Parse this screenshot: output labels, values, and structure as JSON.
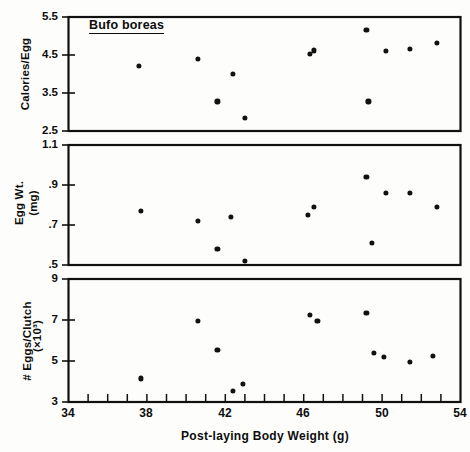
{
  "figure": {
    "species_label": "Bufo boreas",
    "xaxis_title": "Post-laying Body Weight (g)",
    "xticks": [
      "34",
      "38",
      "42",
      "46",
      "50",
      "54"
    ],
    "panels": [
      {
        "name": "calories-per-egg",
        "ylabel": "Calories/Egg",
        "ylabel2": "",
        "yticks": [
          "5.5",
          "4.5",
          "3.5",
          "2.5"
        ]
      },
      {
        "name": "egg-weight",
        "ylabel": "Egg Wt.",
        "ylabel2": "(mg)",
        "yticks": [
          "1.1",
          ".9",
          ".7",
          ".5"
        ]
      },
      {
        "name": "eggs-per-clutch",
        "ylabel": "# Eggs/Clutch",
        "ylabel2": "(×10³)",
        "yticks": [
          "9",
          "7",
          "5",
          "3"
        ]
      }
    ]
  },
  "chart_data": [
    {
      "type": "scatter",
      "title": "Bufo boreas",
      "panel": "Calories/Egg",
      "xlabel": "Post-laying Body Weight (g)",
      "ylabel": "Calories/Egg",
      "xlim": [
        34,
        54
      ],
      "ylim": [
        2.5,
        5.5
      ],
      "xticks": [
        34,
        38,
        42,
        46,
        50,
        54
      ],
      "yticks": [
        2.5,
        3.5,
        4.5,
        5.5
      ],
      "grid": false,
      "legend": "none",
      "x": [
        37.6,
        40.6,
        41.6,
        42.4,
        43.0,
        46.3,
        46.5,
        49.2,
        49.3,
        50.2,
        51.4,
        52.8
      ],
      "y": [
        4.22,
        4.4,
        3.28,
        4.0,
        2.84,
        4.52,
        4.62,
        5.15,
        3.28,
        4.6,
        4.65,
        4.82
      ]
    },
    {
      "type": "scatter",
      "panel": "Egg Wt. (mg)",
      "xlabel": "Post-laying Body Weight (g)",
      "ylabel": "Egg Wt. (mg)",
      "xlim": [
        34,
        54
      ],
      "ylim": [
        0.5,
        1.1
      ],
      "xticks": [
        34,
        38,
        42,
        46,
        50,
        54
      ],
      "yticks": [
        0.5,
        0.7,
        0.9,
        1.1
      ],
      "grid": false,
      "legend": "none",
      "x": [
        37.7,
        40.6,
        41.6,
        42.3,
        43.0,
        46.2,
        46.5,
        49.2,
        49.5,
        50.2,
        51.4,
        52.8
      ],
      "y": [
        0.77,
        0.72,
        0.58,
        0.74,
        0.52,
        0.75,
        0.79,
        0.94,
        0.61,
        0.86,
        0.86,
        0.79
      ]
    },
    {
      "type": "scatter",
      "panel": "# Eggs/Clutch (×10³)",
      "xlabel": "Post-laying Body Weight (g)",
      "ylabel": "# Eggs/Clutch (×10³)",
      "xlim": [
        34,
        54
      ],
      "ylim": [
        3,
        9
      ],
      "xticks": [
        34,
        38,
        42,
        46,
        50,
        54
      ],
      "yticks": [
        3,
        5,
        7,
        9
      ],
      "grid": false,
      "legend": "none",
      "x": [
        37.7,
        40.6,
        41.6,
        42.4,
        42.9,
        46.3,
        46.7,
        49.2,
        49.6,
        50.1,
        51.4,
        52.6
      ],
      "y": [
        4.15,
        6.95,
        5.55,
        3.55,
        3.9,
        7.25,
        6.95,
        7.35,
        5.4,
        5.2,
        4.95,
        5.25
      ]
    }
  ]
}
